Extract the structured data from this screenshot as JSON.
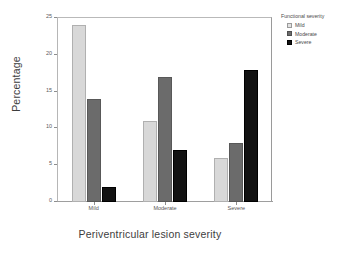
{
  "chart_data": {
    "type": "bar",
    "title": "",
    "subtitle": "",
    "xlabel": "Periventricular lesion severity",
    "ylabel": "Percentage",
    "categories": [
      "Mild",
      "Moderate",
      "Severe"
    ],
    "series": [
      {
        "name": "Mild",
        "color": "#d8d8d8",
        "values": [
          24,
          11,
          6
        ]
      },
      {
        "name": "Moderate",
        "color": "#6b6b6b",
        "values": [
          14,
          17,
          8
        ]
      },
      {
        "name": "Severe",
        "color": "#121212",
        "values": [
          2,
          7,
          18
        ]
      }
    ],
    "ylim": [
      0,
      25
    ],
    "yticks": [
      0,
      5,
      10,
      15,
      20,
      25
    ],
    "ytick_labels": [
      "0",
      "5",
      "10",
      "15",
      "20",
      "25"
    ],
    "grid": false,
    "legend": {
      "title": "Functional severity",
      "position": "right-top",
      "entries": [
        "Mild",
        "Moderate",
        "Severe"
      ]
    }
  },
  "axes": {
    "y_title": "Percentage",
    "x_title": "Periventricular lesion severity",
    "y_tick_labels": [
      "25",
      "20",
      "15",
      "10",
      "5",
      "0"
    ],
    "x_tick_labels": [
      "Mild",
      "Moderate",
      "Severe"
    ]
  },
  "legend": {
    "title": "Functional severity",
    "items": [
      {
        "label": "Mild",
        "swatch": "mild"
      },
      {
        "label": "Moderate",
        "swatch": "moderate"
      },
      {
        "label": "Severe",
        "swatch": "severe"
      }
    ]
  }
}
